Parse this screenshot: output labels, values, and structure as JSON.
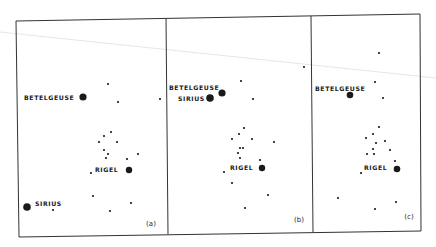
{
  "colors": {
    "background": "#ffffff",
    "ink": "#1a1a1a",
    "frame": "#333333",
    "artifact_line": "#e6e6e6"
  },
  "figure": {
    "type": "star-field panels",
    "frame": {
      "top_left": [
        16,
        21
      ],
      "top_right": [
        420,
        14
      ],
      "bottom_left": [
        19,
        237
      ],
      "bottom_right": [
        421,
        231
      ],
      "dividers": [
        {
          "top": [
            166,
            18
          ],
          "bottom": [
            168,
            234
          ]
        },
        {
          "top": [
            311,
            16
          ],
          "bottom": [
            313,
            232
          ]
        }
      ]
    },
    "artifact_line": {
      "from": [
        0,
        32
      ],
      "to": [
        436,
        78
      ]
    },
    "panels": [
      {
        "caption": "(a)",
        "caption_pos": [
          151,
          226
        ],
        "named_stars": [
          {
            "name": "BETELGEUSE",
            "pos": [
              83,
              97
            ],
            "r": 3.6,
            "label_pos": [
              24,
              99.5
            ]
          },
          {
            "name": "RIGEL",
            "pos": [
              129,
              170
            ],
            "r": 3.2,
            "label_pos": [
              95,
              171.5
            ]
          },
          {
            "name": "SIRIUS",
            "pos": [
              27,
              207
            ],
            "r": 3.8,
            "label_pos": [
              35,
              206
            ]
          }
        ],
        "stars": [
          [
            108,
            84
          ],
          [
            118,
            102
          ],
          [
            160,
            99
          ],
          [
            111,
            132
          ],
          [
            104,
            136
          ],
          [
            99,
            142
          ],
          [
            117,
            142
          ],
          [
            104,
            150
          ],
          [
            108,
            154
          ],
          [
            106,
            158
          ],
          [
            138,
            154
          ],
          [
            127,
            159
          ],
          [
            91,
            173
          ],
          [
            93,
            196
          ],
          [
            131,
            203
          ],
          [
            53,
            210
          ],
          [
            110,
            211
          ]
        ]
      },
      {
        "caption": "(b)",
        "caption_pos": [
          299,
          222
        ],
        "named_stars": [
          {
            "name": "BETELGEUSE",
            "pos": [
              222,
              93
            ],
            "r": 3.6,
            "label_pos": [
              169,
              89.5
            ]
          },
          {
            "name": "SIRIUS",
            "pos": [
              210,
              98
            ],
            "r": 3.8,
            "label_pos": [
              178,
              100.5
            ]
          },
          {
            "name": "RIGEL",
            "pos": [
              262,
              168
            ],
            "r": 3.2,
            "label_pos": [
              230,
              169.5
            ]
          }
        ],
        "stars": [
          [
            304,
            67
          ],
          [
            241,
            81
          ],
          [
            253,
            99
          ],
          [
            244,
            128
          ],
          [
            239,
            134
          ],
          [
            232,
            139
          ],
          [
            252,
            139
          ],
          [
            274,
            142
          ],
          [
            240,
            148
          ],
          [
            243,
            148
          ],
          [
            238,
            153
          ],
          [
            240,
            158
          ],
          [
            260,
            160
          ],
          [
            224,
            172
          ],
          [
            232,
            183
          ],
          [
            268,
            195
          ],
          [
            245,
            208
          ]
        ]
      },
      {
        "caption": "(c)",
        "caption_pos": [
          409,
          219
        ],
        "named_stars": [
          {
            "name": "BETELGEUSE",
            "pos": [
              350,
              95
            ],
            "r": 3.3,
            "label_pos": [
              315,
              90.5
            ]
          },
          {
            "name": "RIGEL",
            "pos": [
              397,
              169
            ],
            "r": 3.3,
            "label_pos": [
              364,
              169.5
            ]
          }
        ],
        "stars": [
          [
            379,
            53
          ],
          [
            375,
            82
          ],
          [
            383,
            98
          ],
          [
            379,
            127
          ],
          [
            373,
            134
          ],
          [
            366,
            138
          ],
          [
            385,
            141
          ],
          [
            376,
            143
          ],
          [
            373,
            149
          ],
          [
            390,
            150
          ],
          [
            367,
            154
          ],
          [
            374,
            154
          ],
          [
            395,
            161
          ],
          [
            361,
            173
          ],
          [
            338,
            198
          ],
          [
            396,
            202
          ],
          [
            375,
            209
          ]
        ]
      }
    ]
  }
}
